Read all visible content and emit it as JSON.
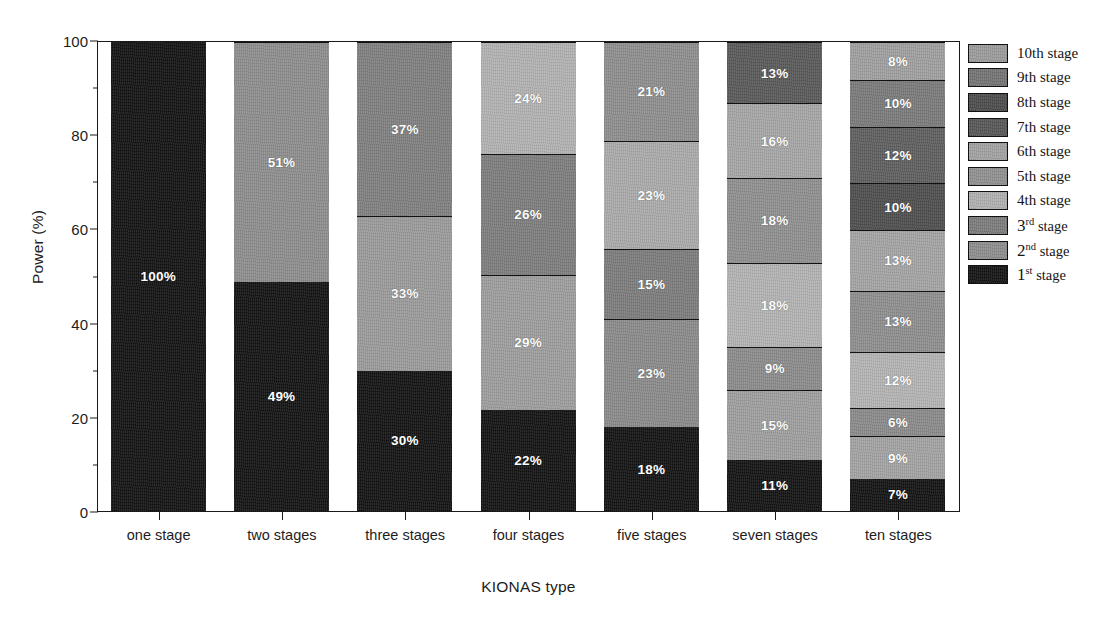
{
  "chart_data": {
    "type": "bar",
    "subtype": "stacked-100-percent",
    "title": "",
    "xlabel": "KIONAS type",
    "ylabel": "Power (%)",
    "ylim": [
      0,
      100
    ],
    "yticks": [
      0,
      20,
      40,
      60,
      80,
      100
    ],
    "ytick_labels": [
      "0",
      "20",
      "40",
      "60",
      "80",
      "100"
    ],
    "yminor_ticks": [
      10,
      30,
      50,
      70,
      90
    ],
    "grid": false,
    "legend_position": "right",
    "categories": [
      "one stage",
      "two stages",
      "three stages",
      "four stages",
      "five stages",
      "seven stages",
      "ten stages"
    ],
    "series": [
      {
        "name": "1st stage",
        "color": "#111111",
        "values": [
          100,
          49,
          30,
          22,
          18,
          11,
          7
        ]
      },
      {
        "name": "2nd stage",
        "color": "#8d8d8d",
        "values": [
          null,
          51,
          33,
          29,
          23,
          15,
          9
        ]
      },
      {
        "name": "3rd stage",
        "color": "#7b7b7b",
        "values": [
          null,
          null,
          37,
          26,
          15,
          9,
          6
        ]
      },
      {
        "name": "4th stage",
        "color": "#b0b0b0",
        "values": [
          null,
          null,
          null,
          24,
          23,
          18,
          12
        ]
      },
      {
        "name": "5th stage",
        "color": "#909090",
        "values": [
          null,
          null,
          null,
          null,
          21,
          18,
          13
        ]
      },
      {
        "name": "6th stage",
        "color": "#a2a2a2",
        "values": [
          null,
          null,
          null,
          null,
          null,
          16,
          13
        ]
      },
      {
        "name": "7th stage",
        "color": "#555555",
        "values": [
          null,
          null,
          null,
          null,
          null,
          13,
          10
        ]
      },
      {
        "name": "8th stage",
        "color": "#4a4a4a",
        "values": [
          null,
          null,
          null,
          null,
          null,
          null,
          12
        ]
      },
      {
        "name": "9th stage",
        "color": "#737373",
        "values": [
          null,
          null,
          null,
          null,
          null,
          null,
          10
        ]
      },
      {
        "name": "10th stage",
        "color": "#9b9b9b",
        "values": [
          null,
          null,
          null,
          null,
          null,
          null,
          8
        ]
      }
    ],
    "bars": [
      {
        "category": "one stage",
        "segments": [
          {
            "series": "1st stage",
            "value": 100,
            "label": "100%",
            "color": "#111111",
            "dark": true
          }
        ]
      },
      {
        "category": "two stages",
        "segments": [
          {
            "series": "1st stage",
            "value": 49,
            "label": "49%",
            "color": "#111111",
            "dark": true
          },
          {
            "series": "2nd stage",
            "value": 51,
            "label": "51%",
            "color": "#8d8d8d",
            "dark": false
          }
        ]
      },
      {
        "category": "three stages",
        "segments": [
          {
            "series": "1st stage",
            "value": 30,
            "label": "30%",
            "color": "#111111",
            "dark": true
          },
          {
            "series": "2nd stage",
            "value": 33,
            "label": "33%",
            "color": "#9a9a9a",
            "dark": false
          },
          {
            "series": "3rd stage",
            "value": 37,
            "label": "37%",
            "color": "#7f7f7f",
            "dark": false
          }
        ]
      },
      {
        "category": "four stages",
        "segments": [
          {
            "series": "1st stage",
            "value": 22,
            "label": "22%",
            "color": "#111111",
            "dark": true
          },
          {
            "series": "2nd stage",
            "value": 29,
            "label": "29%",
            "color": "#9d9d9d",
            "dark": false
          },
          {
            "series": "3rd stage",
            "value": 26,
            "label": "26%",
            "color": "#7d7d7d",
            "dark": false
          },
          {
            "series": "4th stage",
            "value": 24,
            "label": "24%",
            "color": "#b2b2b2",
            "dark": false
          }
        ]
      },
      {
        "category": "five stages",
        "segments": [
          {
            "series": "1st stage",
            "value": 18,
            "label": "18%",
            "color": "#111111",
            "dark": true
          },
          {
            "series": "2nd stage",
            "value": 23,
            "label": "23%",
            "color": "#8a8a8a",
            "dark": false
          },
          {
            "series": "3rd stage",
            "value": 15,
            "label": "15%",
            "color": "#7c7c7c",
            "dark": false
          },
          {
            "series": "4th stage",
            "value": 23,
            "label": "23%",
            "color": "#aaaaaa",
            "dark": false
          },
          {
            "series": "5th stage",
            "value": 21,
            "label": "21%",
            "color": "#8e8e8e",
            "dark": false
          }
        ]
      },
      {
        "category": "seven stages",
        "segments": [
          {
            "series": "1st stage",
            "value": 11,
            "label": "11%",
            "color": "#111111",
            "dark": true
          },
          {
            "series": "2nd stage",
            "value": 15,
            "label": "15%",
            "color": "#9e9e9e",
            "dark": false
          },
          {
            "series": "3rd stage",
            "value": 9,
            "label": "9%",
            "color": "#8b8b8b",
            "dark": false
          },
          {
            "series": "4th stage",
            "value": 18,
            "label": "18%",
            "color": "#b3b3b3",
            "dark": false
          },
          {
            "series": "5th stage",
            "value": 18,
            "label": "18%",
            "color": "#8f8f8f",
            "dark": false
          },
          {
            "series": "6th stage",
            "value": 16,
            "label": "16%",
            "color": "#a6a6a6",
            "dark": false
          },
          {
            "series": "7th stage",
            "value": 13,
            "label": "13%",
            "color": "#585858",
            "dark": true
          }
        ]
      },
      {
        "category": "ten stages",
        "segments": [
          {
            "series": "1st stage",
            "value": 7,
            "label": "7%",
            "color": "#111111",
            "dark": true
          },
          {
            "series": "2nd stage",
            "value": 9,
            "label": "9%",
            "color": "#a3a3a3",
            "dark": false
          },
          {
            "series": "3rd stage",
            "value": 6,
            "label": "6%",
            "color": "#8a8a8a",
            "dark": false
          },
          {
            "series": "4th stage",
            "value": 12,
            "label": "12%",
            "color": "#b4b4b4",
            "dark": false
          },
          {
            "series": "5th stage",
            "value": 13,
            "label": "13%",
            "color": "#8e8e8e",
            "dark": false
          },
          {
            "series": "6th stage",
            "value": 13,
            "label": "13%",
            "color": "#a4a4a4",
            "dark": false
          },
          {
            "series": "7th stage",
            "value": 10,
            "label": "10%",
            "color": "#4d4d4d",
            "dark": true
          },
          {
            "series": "8th stage",
            "value": 12,
            "label": "12%",
            "color": "#5e5e5e",
            "dark": true
          },
          {
            "series": "9th stage",
            "value": 10,
            "label": "10%",
            "color": "#7a7a7a",
            "dark": false
          },
          {
            "series": "10th stage",
            "value": 8,
            "label": "8%",
            "color": "#9f9f9f",
            "dark": false
          }
        ]
      }
    ],
    "legend": [
      {
        "label": "10th stage",
        "ordinal": "10",
        "suffix": "th",
        "superscript": false,
        "color": "#9b9b9b"
      },
      {
        "label": "9th stage",
        "ordinal": "9",
        "suffix": "th",
        "superscript": false,
        "color": "#737373"
      },
      {
        "label": "8th stage",
        "ordinal": "8",
        "suffix": "th",
        "superscript": false,
        "color": "#4a4a4a"
      },
      {
        "label": "7th stage",
        "ordinal": "7",
        "suffix": "th",
        "superscript": false,
        "color": "#555555"
      },
      {
        "label": "6th stage",
        "ordinal": "6",
        "suffix": "th",
        "superscript": false,
        "color": "#a2a2a2"
      },
      {
        "label": "5th stage",
        "ordinal": "5",
        "suffix": "th",
        "superscript": false,
        "color": "#909090"
      },
      {
        "label": "4th stage",
        "ordinal": "4",
        "suffix": "th",
        "superscript": false,
        "color": "#b0b0b0"
      },
      {
        "label": "3rd stage",
        "ordinal": "3",
        "suffix": "rd",
        "superscript": true,
        "color": "#7b7b7b"
      },
      {
        "label": "2nd stage",
        "ordinal": "2",
        "suffix": "nd",
        "superscript": true,
        "color": "#8d8d8d"
      },
      {
        "label": "1st stage",
        "ordinal": "1",
        "suffix": "st",
        "superscript": true,
        "color": "#111111"
      }
    ],
    "legend_word": "stage"
  }
}
